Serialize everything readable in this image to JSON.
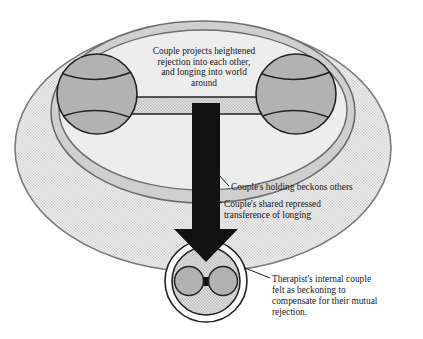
{
  "figure": {
    "background_color": "#ffffff"
  },
  "colors": {
    "stipple_light": "#e8e8e8",
    "ring_band": "#cfcfcf",
    "inner_field": "#ececec",
    "circle_fill": "#b2b2b2",
    "outline": "#6e6e6e",
    "dark_outline": "#222222",
    "arrow": "#111111",
    "text": "#1a1a1a"
  },
  "captions": {
    "top": {
      "line1": "Couple projects heightened",
      "line2": "rejection into each other,",
      "line3": "and longing into world",
      "line4": "around"
    },
    "holding": "Couple's holding beckons others",
    "transference": {
      "line1": "Couple's shared repressed",
      "line2": "transference of longing"
    },
    "therapist": {
      "line1": "Therapist's internal couple",
      "line2": "felt as beckoning to",
      "line3": "compensate for their mutual",
      "line4": "rejection."
    }
  },
  "shapes": {
    "outer_ellipse_name": "world-around-ellipse",
    "ring_band_name": "couple-holding-ring",
    "inner_ellipse_name": "couple-inner-field",
    "left_partner_name": "left-partner-circle",
    "right_partner_name": "right-partner-circle",
    "connector_name": "couple-connector-bar",
    "arrow_name": "transference-arrow",
    "therapist_circle_name": "therapist-internal-couple"
  }
}
